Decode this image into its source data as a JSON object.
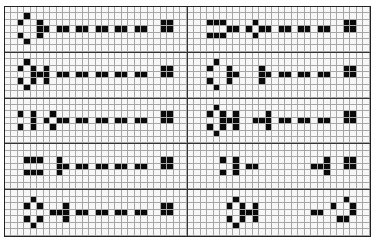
{
  "board": {
    "columns_per_panel": 28,
    "rows_per_panel": 7,
    "colors": {
      "filled": "#0a0a0a",
      "empty": "#f7f7f7",
      "gridline": "#a6a6a6",
      "divider": "#333333"
    },
    "panels": [
      {
        "id": "p0L",
        "filled": [
          [
            1,
            3
          ],
          [
            2,
            2
          ],
          [
            2,
            5
          ],
          [
            2,
            24
          ],
          [
            2,
            25
          ],
          [
            3,
            5
          ],
          [
            3,
            6
          ],
          [
            3,
            8
          ],
          [
            3,
            9
          ],
          [
            3,
            11
          ],
          [
            3,
            12
          ],
          [
            3,
            14
          ],
          [
            3,
            15
          ],
          [
            3,
            17
          ],
          [
            3,
            18
          ],
          [
            3,
            20
          ],
          [
            3,
            21
          ],
          [
            3,
            24
          ],
          [
            3,
            25
          ],
          [
            4,
            2
          ],
          [
            4,
            5
          ],
          [
            5,
            3
          ]
        ]
      },
      {
        "id": "p0R",
        "filled": [
          [
            2,
            3
          ],
          [
            2,
            4
          ],
          [
            2,
            5
          ],
          [
            2,
            10
          ],
          [
            2,
            24
          ],
          [
            2,
            25
          ],
          [
            3,
            6
          ],
          [
            3,
            7
          ],
          [
            3,
            9
          ],
          [
            3,
            11
          ],
          [
            3,
            12
          ],
          [
            3,
            14
          ],
          [
            3,
            15
          ],
          [
            3,
            17
          ],
          [
            3,
            18
          ],
          [
            3,
            20
          ],
          [
            3,
            21
          ],
          [
            3,
            24
          ],
          [
            3,
            25
          ],
          [
            4,
            3
          ],
          [
            4,
            4
          ],
          [
            4,
            5
          ],
          [
            4,
            10
          ]
        ]
      },
      {
        "id": "p1L",
        "filled": [
          [
            1,
            3
          ],
          [
            2,
            2
          ],
          [
            2,
            4
          ],
          [
            2,
            6
          ],
          [
            2,
            24
          ],
          [
            2,
            25
          ],
          [
            3,
            4
          ],
          [
            3,
            5
          ],
          [
            3,
            6
          ],
          [
            3,
            8
          ],
          [
            3,
            9
          ],
          [
            3,
            11
          ],
          [
            3,
            12
          ],
          [
            3,
            14
          ],
          [
            3,
            15
          ],
          [
            3,
            17
          ],
          [
            3,
            18
          ],
          [
            3,
            20
          ],
          [
            3,
            21
          ],
          [
            3,
            24
          ],
          [
            3,
            25
          ],
          [
            4,
            2
          ],
          [
            4,
            4
          ],
          [
            4,
            6
          ],
          [
            5,
            3
          ]
        ]
      },
      {
        "id": "p1R",
        "filled": [
          [
            1,
            4
          ],
          [
            2,
            3
          ],
          [
            2,
            6
          ],
          [
            2,
            11
          ],
          [
            2,
            24
          ],
          [
            2,
            25
          ],
          [
            3,
            6
          ],
          [
            3,
            7
          ],
          [
            3,
            11
          ],
          [
            3,
            12
          ],
          [
            3,
            14
          ],
          [
            3,
            15
          ],
          [
            3,
            17
          ],
          [
            3,
            18
          ],
          [
            3,
            20
          ],
          [
            3,
            21
          ],
          [
            3,
            24
          ],
          [
            3,
            25
          ],
          [
            4,
            3
          ],
          [
            4,
            6
          ],
          [
            4,
            11
          ],
          [
            5,
            4
          ]
        ]
      },
      {
        "id": "p2L",
        "filled": [
          [
            2,
            2
          ],
          [
            2,
            4
          ],
          [
            2,
            7
          ],
          [
            2,
            24
          ],
          [
            2,
            25
          ],
          [
            3,
            4
          ],
          [
            3,
            6
          ],
          [
            3,
            8
          ],
          [
            3,
            9
          ],
          [
            3,
            11
          ],
          [
            3,
            12
          ],
          [
            3,
            14
          ],
          [
            3,
            15
          ],
          [
            3,
            17
          ],
          [
            3,
            18
          ],
          [
            3,
            20
          ],
          [
            3,
            21
          ],
          [
            3,
            24
          ],
          [
            3,
            25
          ],
          [
            4,
            2
          ],
          [
            4,
            4
          ],
          [
            4,
            7
          ]
        ]
      },
      {
        "id": "p2R",
        "filled": [
          [
            1,
            4
          ],
          [
            2,
            3
          ],
          [
            2,
            5
          ],
          [
            2,
            7
          ],
          [
            2,
            12
          ],
          [
            2,
            24
          ],
          [
            2,
            25
          ],
          [
            3,
            5
          ],
          [
            3,
            6
          ],
          [
            3,
            7
          ],
          [
            3,
            10
          ],
          [
            3,
            11
          ],
          [
            3,
            12
          ],
          [
            3,
            14
          ],
          [
            3,
            15
          ],
          [
            3,
            17
          ],
          [
            3,
            18
          ],
          [
            3,
            20
          ],
          [
            3,
            21
          ],
          [
            3,
            24
          ],
          [
            3,
            25
          ],
          [
            4,
            3
          ],
          [
            4,
            5
          ],
          [
            4,
            7
          ],
          [
            4,
            12
          ],
          [
            5,
            4
          ]
        ]
      },
      {
        "id": "p3L",
        "filled": [
          [
            2,
            3
          ],
          [
            2,
            4
          ],
          [
            2,
            5
          ],
          [
            2,
            8
          ],
          [
            2,
            24
          ],
          [
            2,
            25
          ],
          [
            3,
            8
          ],
          [
            3,
            9
          ],
          [
            3,
            11
          ],
          [
            3,
            12
          ],
          [
            3,
            14
          ],
          [
            3,
            15
          ],
          [
            3,
            17
          ],
          [
            3,
            18
          ],
          [
            3,
            20
          ],
          [
            3,
            21
          ],
          [
            3,
            24
          ],
          [
            3,
            25
          ],
          [
            4,
            3
          ],
          [
            4,
            4
          ],
          [
            4,
            5
          ],
          [
            4,
            8
          ]
        ]
      },
      {
        "id": "p3R",
        "filled": [
          [
            2,
            5
          ],
          [
            2,
            7
          ],
          [
            2,
            21
          ],
          [
            2,
            24
          ],
          [
            2,
            25
          ],
          [
            3,
            7
          ],
          [
            3,
            9
          ],
          [
            3,
            10
          ],
          [
            3,
            19
          ],
          [
            3,
            20
          ],
          [
            3,
            21
          ],
          [
            3,
            24
          ],
          [
            3,
            25
          ],
          [
            4,
            5
          ],
          [
            4,
            7
          ],
          [
            4,
            21
          ]
        ]
      },
      {
        "id": "p4L",
        "filled": [
          [
            1,
            4
          ],
          [
            2,
            3
          ],
          [
            2,
            5
          ],
          [
            2,
            9
          ],
          [
            2,
            24
          ],
          [
            2,
            25
          ],
          [
            3,
            7
          ],
          [
            3,
            8
          ],
          [
            3,
            9
          ],
          [
            3,
            11
          ],
          [
            3,
            12
          ],
          [
            3,
            14
          ],
          [
            3,
            15
          ],
          [
            3,
            17
          ],
          [
            3,
            18
          ],
          [
            3,
            20
          ],
          [
            3,
            21
          ],
          [
            3,
            24
          ],
          [
            3,
            25
          ],
          [
            4,
            3
          ],
          [
            4,
            5
          ],
          [
            4,
            9
          ],
          [
            5,
            4
          ]
        ]
      },
      {
        "id": "p4R",
        "filled": [
          [
            1,
            7
          ],
          [
            1,
            24
          ],
          [
            2,
            6
          ],
          [
            2,
            8
          ],
          [
            2,
            10
          ],
          [
            2,
            22
          ],
          [
            2,
            25
          ],
          [
            3,
            8
          ],
          [
            3,
            9
          ],
          [
            3,
            10
          ],
          [
            3,
            19
          ],
          [
            3,
            20
          ],
          [
            3,
            25
          ],
          [
            4,
            6
          ],
          [
            4,
            8
          ],
          [
            4,
            10
          ],
          [
            4,
            23
          ],
          [
            4,
            24
          ],
          [
            5,
            7
          ]
        ]
      }
    ]
  }
}
